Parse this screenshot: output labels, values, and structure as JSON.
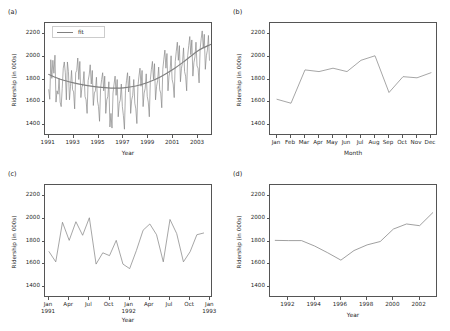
{
  "figure": {
    "panels": [
      "a",
      "b",
      "c",
      "d"
    ],
    "line_color": "#808080",
    "axis_color": "#555555",
    "background": "#ffffff"
  },
  "panel_a": {
    "letter": "(a)",
    "legend_label": "fit",
    "ylabel": "Ridership (in 000s)",
    "xlabel": "Year",
    "yticks": [
      "1400",
      "1600",
      "1800",
      "2000",
      "2200"
    ],
    "xticks": [
      "1991",
      "1993",
      "1995",
      "1997",
      "1999",
      "2001",
      "2003"
    ]
  },
  "panel_b": {
    "letter": "(b)",
    "ylabel": "Ridership (in 000s)",
    "xlabel": "Month",
    "yticks": [
      "1400",
      "1600",
      "1800",
      "2000",
      "2200"
    ],
    "xticks": [
      "Jan",
      "Feb",
      "Mar",
      "Apr",
      "May",
      "Jun",
      "Jul",
      "Aug",
      "Sep",
      "Oct",
      "Nov",
      "Dec"
    ]
  },
  "panel_c": {
    "letter": "(c)",
    "ylabel": "Ridership (in 000s)",
    "xlabel": "Year",
    "yticks": [
      "1400",
      "1600",
      "1800",
      "2000",
      "2200"
    ],
    "xticks": [
      {
        "line1": "Jan",
        "line2": "1991"
      },
      {
        "line1": "Apr",
        "line2": ""
      },
      {
        "line1": "Jul",
        "line2": ""
      },
      {
        "line1": "Oct",
        "line2": ""
      },
      {
        "line1": "Jan",
        "line2": "1992"
      },
      {
        "line1": "Apr",
        "line2": ""
      },
      {
        "line1": "Jul",
        "line2": ""
      },
      {
        "line1": "Oct",
        "line2": ""
      },
      {
        "line1": "Jan",
        "line2": "1993"
      }
    ]
  },
  "panel_d": {
    "letter": "(d)",
    "ylabel": "Ridership (in 000s)",
    "xlabel": "Year",
    "yticks": [
      "1400",
      "1600",
      "1800",
      "2000",
      "2200"
    ],
    "xticks": [
      "1992",
      "1994",
      "1996",
      "1998",
      "2000",
      "2002"
    ]
  },
  "chart_data": [
    {
      "type": "line",
      "panel": "a",
      "title": "(a)",
      "xlabel": "Year",
      "ylabel": "Ridership (in 000s)",
      "xlim": [
        1990.7,
        2004.2
      ],
      "ylim": [
        1300,
        2300
      ],
      "grid": false,
      "legend": [
        "fit"
      ],
      "legend_position": "upper left",
      "series": [
        {
          "name": "monthly ridership",
          "x": [
            1991.0,
            1991.083,
            1991.167,
            1991.25,
            1991.333,
            1991.417,
            1991.5,
            1991.583,
            1991.667,
            1991.75,
            1991.833,
            1991.917,
            1992.0,
            1992.083,
            1992.167,
            1992.25,
            1992.333,
            1992.417,
            1992.5,
            1992.583,
            1992.667,
            1992.75,
            1992.833,
            1992.917,
            1993.0,
            1993.083,
            1993.167,
            1993.25,
            1993.333,
            1993.417,
            1993.5,
            1993.583,
            1993.667,
            1993.75,
            1993.833,
            1993.917,
            1994.0,
            1994.083,
            1994.167,
            1994.25,
            1994.333,
            1994.417,
            1994.5,
            1994.583,
            1994.667,
            1994.75,
            1994.833,
            1994.917,
            1995.0,
            1995.083,
            1995.167,
            1995.25,
            1995.333,
            1995.417,
            1995.5,
            1995.583,
            1995.667,
            1995.75,
            1995.833,
            1995.917,
            1996.0,
            1996.083,
            1996.167,
            1996.25,
            1996.333,
            1996.417,
            1996.5,
            1996.583,
            1996.667,
            1996.75,
            1996.833,
            1996.917,
            1997.0,
            1997.083,
            1997.167,
            1997.25,
            1997.333,
            1997.417,
            1997.5,
            1997.583,
            1997.667,
            1997.75,
            1997.833,
            1997.917,
            1998.0,
            1998.083,
            1998.167,
            1998.25,
            1998.333,
            1998.417,
            1998.5,
            1998.583,
            1998.667,
            1998.75,
            1998.833,
            1998.917,
            1999.0,
            1999.083,
            1999.167,
            1999.25,
            1999.333,
            1999.417,
            1999.5,
            1999.583,
            1999.667,
            1999.75,
            1999.833,
            1999.917,
            2000.0,
            2000.083,
            2000.167,
            2000.25,
            2000.333,
            2000.417,
            2000.5,
            2000.583,
            2000.667,
            2000.75,
            2000.833,
            2000.917,
            2001.0,
            2001.083,
            2001.167,
            2001.25,
            2001.333,
            2001.417,
            2001.5,
            2001.583,
            2001.667,
            2001.75,
            2001.833,
            2001.917,
            2002.0,
            2002.083,
            2002.167,
            2002.25,
            2002.333,
            2002.417,
            2002.5,
            2002.583,
            2002.667,
            2002.75,
            2002.833,
            2002.917,
            2003.0,
            2003.083,
            2003.167,
            2003.25,
            2003.333,
            2003.417,
            2003.5,
            2003.583,
            2003.667,
            2003.75,
            2003.833,
            2003.917
          ],
          "y": [
            1710,
            1625,
            1975,
            1810,
            1970,
            1855,
            2015,
            1600,
            1700,
            1670,
            1810,
            1600,
            1560,
            1720,
            1900,
            1955,
            1860,
            1620,
            1955,
            1870,
            1620,
            1740,
            1880,
            1710,
            1690,
            1540,
            1860,
            1880,
            1990,
            1800,
            1960,
            1640,
            1730,
            1760,
            1870,
            1650,
            1620,
            1500,
            1790,
            1840,
            1930,
            1760,
            1880,
            1570,
            1680,
            1700,
            1820,
            1610,
            1560,
            1430,
            1720,
            1800,
            1860,
            1700,
            1830,
            1500,
            1620,
            1650,
            1780,
            1380,
            1500,
            1370,
            1680,
            1760,
            1830,
            1660,
            1800,
            1470,
            1590,
            1620,
            1760,
            1560,
            1480,
            1360,
            1700,
            1790,
            1860,
            1690,
            1830,
            1500,
            1620,
            1660,
            1800,
            1590,
            1540,
            1410,
            1740,
            1830,
            1900,
            1740,
            1880,
            1560,
            1680,
            1720,
            1850,
            1650,
            1600,
            1470,
            1800,
            1890,
            1960,
            1800,
            1940,
            1620,
            1740,
            1790,
            1910,
            1710,
            1680,
            1550,
            1890,
            1980,
            2060,
            1900,
            2030,
            1700,
            1830,
            1880,
            2010,
            1800,
            1760,
            1640,
            1960,
            2050,
            2130,
            1970,
            2100,
            1780,
            1900,
            1950,
            2080,
            1870,
            1830,
            1700,
            2010,
            2100,
            2180,
            2020,
            2150,
            1830,
            1950,
            2000,
            2130,
            1920,
            1900,
            1770,
            2070,
            2160,
            2230,
            2080,
            2200,
            1890,
            2010,
            2060,
            2190,
            1970
          ]
        },
        {
          "name": "fit",
          "description": "smooth quadratic trend",
          "x": [
            1991.0,
            1992.0,
            1993.0,
            1994.0,
            1995.0,
            1996.0,
            1997.0,
            1998.0,
            1999.0,
            2000.0,
            2001.0,
            2002.0,
            2003.0,
            2004.0
          ],
          "y": [
            1845,
            1800,
            1770,
            1748,
            1732,
            1724,
            1726,
            1742,
            1775,
            1825,
            1890,
            1970,
            2055,
            2110
          ]
        }
      ]
    },
    {
      "type": "line",
      "panel": "b",
      "title": "(b)",
      "xlabel": "Month",
      "ylabel": "Ridership (in 000s)",
      "categories": [
        "Jan",
        "Feb",
        "Mar",
        "Apr",
        "May",
        "Jun",
        "Jul",
        "Aug",
        "Sep",
        "Oct",
        "Nov",
        "Dec"
      ],
      "values": [
        1625,
        1590,
        1885,
        1870,
        1900,
        1870,
        1970,
        2010,
        1685,
        1825,
        1815,
        1860
      ],
      "ylim": [
        1300,
        2300
      ],
      "grid": false
    },
    {
      "type": "line",
      "panel": "c",
      "title": "(c)",
      "xlabel": "Year",
      "ylabel": "Ridership (in 000s)",
      "categories": [
        "Jan 1991",
        "Feb 1991",
        "Mar 1991",
        "Apr 1991",
        "May 1991",
        "Jun 1991",
        "Jul 1991",
        "Aug 1991",
        "Sep 1991",
        "Oct 1991",
        "Nov 1991",
        "Dec 1991",
        "Jan 1992",
        "Feb 1992",
        "Mar 1992",
        "Apr 1992",
        "May 1992",
        "Jun 1992",
        "Jul 1992",
        "Aug 1992",
        "Sep 1992",
        "Oct 1992",
        "Nov 1992",
        "Dec 1992"
      ],
      "values": [
        1710,
        1620,
        1970,
        1810,
        1975,
        1855,
        2010,
        1600,
        1700,
        1675,
        1810,
        1600,
        1560,
        1720,
        1900,
        1955,
        1860,
        1620,
        1995,
        1870,
        1620,
        1710,
        1860,
        1875
      ],
      "ylim": [
        1300,
        2300
      ],
      "grid": false
    },
    {
      "type": "line",
      "panel": "d",
      "title": "(d)",
      "xlabel": "Year",
      "ylabel": "Ridership (in 000s)",
      "categories": [
        "1991",
        "1992",
        "1993",
        "1994",
        "1995",
        "1996",
        "1997",
        "1998",
        "1999",
        "2000",
        "2001",
        "2002",
        "2003"
      ],
      "values": [
        1810,
        1808,
        1808,
        1760,
        1700,
        1635,
        1720,
        1770,
        1800,
        1910,
        1955,
        1940,
        2055
      ],
      "ylim": [
        1300,
        2300
      ],
      "grid": false
    }
  ]
}
